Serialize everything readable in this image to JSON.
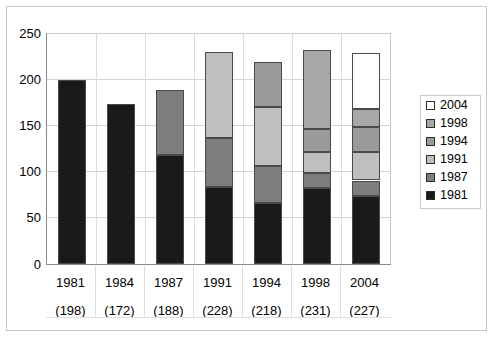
{
  "chart_data": {
    "type": "bar",
    "subtype": "stacked-bar",
    "title": "",
    "xlabel": "",
    "ylabel": "",
    "ylim": [
      0,
      250
    ],
    "yticks": [
      0,
      50,
      100,
      150,
      200,
      250
    ],
    "grid": true,
    "legend_position": "right",
    "categories": [
      "1981",
      "1984",
      "1987",
      "1991",
      "1994",
      "1998",
      "2004"
    ],
    "category_totals": [
      198,
      172,
      188,
      228,
      218,
      231,
      227
    ],
    "category_total_labels": [
      "(198)",
      "(172)",
      "(188)",
      "(228)",
      "(218)",
      "(231)",
      "(227)"
    ],
    "series": [
      {
        "name": "1981",
        "color": "#1a1a1a",
        "values": [
          198,
          172,
          117,
          83,
          66,
          82,
          73
        ]
      },
      {
        "name": "1987",
        "color": "#7d7d7d",
        "values": [
          0,
          0,
          71,
          53,
          40,
          16,
          17
        ]
      },
      {
        "name": "1991",
        "color": "#bfbfbf",
        "values": [
          0,
          0,
          0,
          92,
          63,
          23,
          31
        ]
      },
      {
        "name": "1994",
        "color": "#9a9a9a",
        "values": [
          0,
          0,
          0,
          0,
          49,
          24,
          27
        ]
      },
      {
        "name": "1998",
        "color": "#a8a8a8",
        "values": [
          0,
          0,
          0,
          0,
          0,
          86,
          19
        ]
      },
      {
        "name": "2004",
        "color": "#ffffff",
        "values": [
          0,
          0,
          0,
          0,
          0,
          0,
          60
        ]
      }
    ],
    "stack_order_bottom_to_top": [
      "1981",
      "1987",
      "1991",
      "1994",
      "1998",
      "2004"
    ]
  },
  "legend": {
    "items": [
      {
        "label": "2004",
        "color": "#ffffff"
      },
      {
        "label": "1998",
        "color": "#a8a8a8"
      },
      {
        "label": "1994",
        "color": "#9a9a9a"
      },
      {
        "label": "1991",
        "color": "#bfbfbf"
      },
      {
        "label": "1987",
        "color": "#7d7d7d"
      },
      {
        "label": "1981",
        "color": "#1a1a1a"
      }
    ]
  },
  "axis": {
    "y_tick_labels": [
      "250",
      "200",
      "150",
      "100",
      "50",
      "0"
    ]
  },
  "colors": {
    "frame": "#c8c8c8",
    "gridline": "#d4d4d4",
    "axis": "#888888",
    "segment_border": "#4a4a4a",
    "background": "#ffffff"
  }
}
